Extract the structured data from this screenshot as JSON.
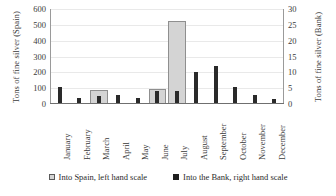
{
  "chart_data": {
    "type": "bar",
    "title": "",
    "xlabel": "",
    "categories": [
      "January",
      "February",
      "March",
      "April",
      "May",
      "June",
      "July",
      "August",
      "September",
      "October",
      "November",
      "December"
    ],
    "series": [
      {
        "name": "Into Spain, left hand scale",
        "axis": "left",
        "color": "#d4d4d4",
        "values": [
          0,
          0,
          90,
          0,
          0,
          95,
          525,
          0,
          0,
          0,
          0,
          0
        ]
      },
      {
        "name": "Into the Bank, right hand scale",
        "axis": "right",
        "color": "#2a2a2a",
        "values": [
          5.5,
          2,
          2.5,
          3,
          2,
          4,
          4,
          10,
          12,
          5.5,
          3,
          1.5
        ]
      }
    ],
    "left_axis": {
      "label": "Tons of fine silver (Spain)",
      "ticks": [
        0,
        100,
        200,
        300,
        400,
        500,
        600
      ],
      "ylim": [
        0,
        600
      ]
    },
    "right_axis": {
      "label": "Tons of fine silver (Bank)",
      "ticks": [
        0,
        5,
        10,
        15,
        20,
        25,
        30
      ],
      "ylim": [
        0,
        30
      ]
    },
    "grid": true,
    "legend_position": "bottom"
  },
  "legend": {
    "items": [
      {
        "label": "Into Spain, left hand scale",
        "swatch": "light-gray-square"
      },
      {
        "label": "Into the Bank, right hand scale",
        "swatch": "dark-square"
      }
    ]
  }
}
